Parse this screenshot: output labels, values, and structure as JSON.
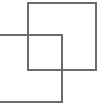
{
  "shapes": [
    {
      "name": "back-square",
      "stroke": "#6b6b6b"
    },
    {
      "name": "front-square",
      "stroke": "#6b6b6b"
    }
  ]
}
